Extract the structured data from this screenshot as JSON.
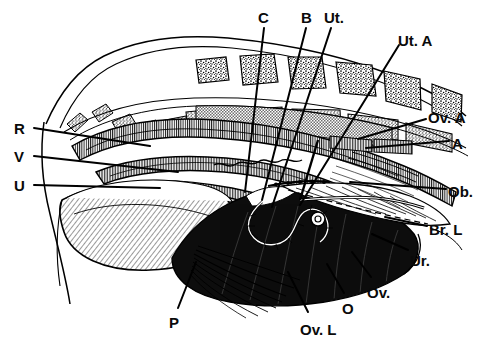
{
  "figure": {
    "kind": "anatomical-line-drawing",
    "background_color": "#ffffff",
    "ink_color": "#000000",
    "fill_dark": "#0d0d0d",
    "fill_mid": "#b8b8b8",
    "fill_light": "#e2e2e2",
    "style": "pen-and-ink hatched engraving"
  },
  "labels": [
    {
      "id": "R",
      "text": "R",
      "x": 14,
      "y": 121,
      "anchor": "start",
      "leader": [
        [
          34,
          128
        ],
        [
          150,
          146
        ]
      ]
    },
    {
      "id": "V",
      "text": "V",
      "x": 14,
      "y": 149,
      "anchor": "start",
      "leader": [
        [
          34,
          156
        ],
        [
          178,
          172
        ]
      ]
    },
    {
      "id": "U",
      "text": "U",
      "x": 14,
      "y": 178,
      "anchor": "start",
      "leader": [
        [
          34,
          185
        ],
        [
          160,
          188
        ]
      ]
    },
    {
      "id": "C",
      "text": "C",
      "x": 258,
      "y": 10,
      "anchor": "start",
      "leader": [
        [
          264,
          28
        ],
        [
          245,
          192
        ]
      ]
    },
    {
      "id": "B",
      "text": "B",
      "x": 301,
      "y": 10,
      "anchor": "start",
      "leader": [
        [
          306,
          28
        ],
        [
          262,
          200
        ]
      ]
    },
    {
      "id": "Ut",
      "text": "Ut.",
      "x": 324,
      "y": 10,
      "anchor": "start",
      "leader": [
        [
          331,
          28
        ],
        [
          272,
          207
        ]
      ]
    },
    {
      "id": "UtA",
      "text": "Ut. A",
      "x": 398,
      "y": 33,
      "anchor": "start",
      "leader": [
        [
          399,
          45
        ],
        [
          300,
          205
        ]
      ]
    },
    {
      "id": "OvA",
      "text": "Ov. A",
      "x": 428,
      "y": 110,
      "anchor": "start",
      "leader": [
        [
          426,
          119
        ],
        [
          358,
          139
        ]
      ]
    },
    {
      "id": "A",
      "text": "A",
      "x": 452,
      "y": 136,
      "anchor": "start",
      "leader": [
        [
          449,
          141
        ],
        [
          366,
          148
        ]
      ]
    },
    {
      "id": "Ob",
      "text": "Ob.",
      "x": 448,
      "y": 184,
      "anchor": "start",
      "leader": [
        [
          446,
          189
        ],
        [
          350,
          182
        ]
      ]
    },
    {
      "id": "BrL",
      "text": "Br. L",
      "x": 429,
      "y": 222,
      "anchor": "start",
      "leader": [
        [
          427,
          226
        ],
        [
          385,
          217
        ]
      ]
    },
    {
      "id": "Ur",
      "text": "Ur.",
      "x": 410,
      "y": 253,
      "anchor": "start",
      "leader": [
        [
          408,
          250
        ],
        [
          372,
          234
        ]
      ]
    },
    {
      "id": "Ov",
      "text": "Ov.",
      "x": 367,
      "y": 285,
      "anchor": "start",
      "leader": [
        [
          371,
          277
        ],
        [
          352,
          252
        ]
      ]
    },
    {
      "id": "O",
      "text": "O",
      "x": 342,
      "y": 301,
      "anchor": "start",
      "leader": [
        [
          344,
          293
        ],
        [
          327,
          264
        ]
      ]
    },
    {
      "id": "OvL",
      "text": "Ov. L",
      "x": 300,
      "y": 322,
      "anchor": "start",
      "leader": [
        [
          308,
          312
        ],
        [
          288,
          272
        ]
      ]
    },
    {
      "id": "P",
      "text": "P",
      "x": 169,
      "y": 315,
      "anchor": "start",
      "leader": [
        [
          178,
          308
        ],
        [
          196,
          262
        ]
      ]
    }
  ],
  "legend_meaning": [
    {
      "abbr": "R",
      "meaning": "Rectum"
    },
    {
      "abbr": "V",
      "meaning": "Vagina"
    },
    {
      "abbr": "U",
      "meaning": "Urethra"
    },
    {
      "abbr": "C",
      "meaning": "Cervix"
    },
    {
      "abbr": "B",
      "meaning": "Body of uterus"
    },
    {
      "abbr": "Ut.",
      "meaning": "Uterine horn"
    },
    {
      "abbr": "Ut. A",
      "meaning": "Uterine artery"
    },
    {
      "abbr": "Ov. A",
      "meaning": "Ovarian artery"
    },
    {
      "abbr": "A",
      "meaning": "Artery"
    },
    {
      "abbr": "Ob.",
      "meaning": "Obturator"
    },
    {
      "abbr": "Br. L",
      "meaning": "Broad ligament"
    },
    {
      "abbr": "Ur.",
      "meaning": "Ureter"
    },
    {
      "abbr": "Ov.",
      "meaning": "Ovary"
    },
    {
      "abbr": "O",
      "meaning": "Oviduct"
    },
    {
      "abbr": "Ov. L",
      "meaning": "Ovarian ligament"
    },
    {
      "abbr": "P",
      "meaning": "Pelvic floor / pubis"
    }
  ]
}
